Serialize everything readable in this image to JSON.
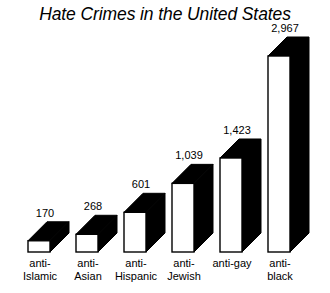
{
  "chart": {
    "title": "Hate Crimes in the United States"
  },
  "chart_data": {
    "type": "bar",
    "title": "Hate Crimes in the United States",
    "xlabel": "",
    "ylabel": "",
    "ylim": [
      0,
      2967
    ],
    "grid": false,
    "legend": null,
    "style": "3d-isometric-bars",
    "categories": [
      "anti-Islamic",
      "anti-Asian",
      "anti-Hispanic",
      "anti-Jewish",
      "anti-gay",
      "anti-black"
    ],
    "category_lines": [
      [
        "anti-",
        "Islamic"
      ],
      [
        "anti-",
        "Asian"
      ],
      [
        "anti-",
        "Hispanic"
      ],
      [
        "anti-",
        "Jewish"
      ],
      [
        "anti-gay"
      ],
      [
        "anti-",
        "black"
      ]
    ],
    "values": [
      170,
      268,
      601,
      1039,
      1423,
      2967
    ],
    "value_labels": [
      "170",
      "268",
      "601",
      "1,039",
      "1,423",
      "2,967"
    ],
    "colors": {
      "bar_front": "#ffffff",
      "bar_shade": "#000000",
      "outline": "#000000",
      "background": "#ffffff",
      "text": "#000000"
    }
  }
}
